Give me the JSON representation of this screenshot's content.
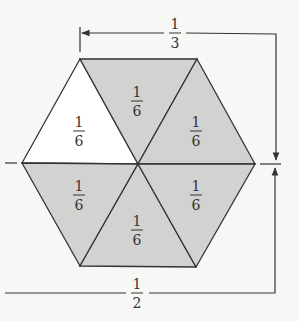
{
  "diagram": {
    "colors": {
      "background": "#f7f7f5",
      "shaded": "#d2d2d0",
      "unshaded": "#ffffff",
      "stroke": "#333333"
    },
    "triangles": [
      {
        "position": "upper-left",
        "shaded": false,
        "num": "1",
        "den": "6"
      },
      {
        "position": "top",
        "shaded": true,
        "num": "1",
        "den": "6"
      },
      {
        "position": "upper-right",
        "shaded": true,
        "num": "1",
        "den": "6"
      },
      {
        "position": "lower-left",
        "shaded": true,
        "num": "1",
        "den": "6"
      },
      {
        "position": "bottom",
        "shaded": true,
        "num": "1",
        "den": "6"
      },
      {
        "position": "lower-right",
        "shaded": true,
        "num": "1",
        "den": "6"
      }
    ],
    "dimensions": {
      "top": {
        "num": "1",
        "den": "3"
      },
      "bottom": {
        "num": "1",
        "den": "2"
      }
    }
  }
}
